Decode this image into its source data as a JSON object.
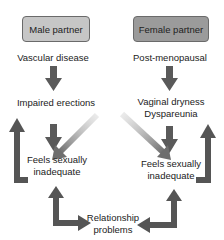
{
  "colors": {
    "male_box_fill": "#c6c6c6",
    "female_box_fill": "#9b9b9b",
    "arrow_dark": "#555555",
    "arrow_light": "#8a8a8a",
    "box_border": "#6a6a6a"
  },
  "headers": {
    "male": "Male partner",
    "female": "Female partner"
  },
  "male_chain": {
    "cause": "Vascular disease",
    "symptom": "Impaired erections",
    "feeling_line1": "Feels sexually",
    "feeling_line2": "inadequate"
  },
  "female_chain": {
    "cause": "Post-menopausal",
    "symptom_line1": "Vaginal dryness",
    "symptom_line2": "Dyspareunia",
    "feeling_line1": "Feels sexually",
    "feeling_line2": "inadequate"
  },
  "outcome": {
    "line1": "Relationship",
    "line2": "problems"
  },
  "arrows": [
    {
      "name": "male-cause-to-symptom",
      "type": "down"
    },
    {
      "name": "female-cause-to-symptom",
      "type": "down"
    },
    {
      "name": "male-symptom-to-feeling",
      "type": "down"
    },
    {
      "name": "female-symptom-to-feeling",
      "type": "down"
    },
    {
      "name": "male-symptom-to-female-feeling",
      "type": "cross"
    },
    {
      "name": "female-symptom-to-male-feeling",
      "type": "cross"
    },
    {
      "name": "male-feeling-loop-to-symptom",
      "type": "loop-up"
    },
    {
      "name": "female-feeling-loop-to-symptom",
      "type": "loop-up"
    },
    {
      "name": "male-feeling-relationship",
      "type": "bidirectional-elbow"
    },
    {
      "name": "female-feeling-relationship",
      "type": "bidirectional-elbow"
    }
  ]
}
